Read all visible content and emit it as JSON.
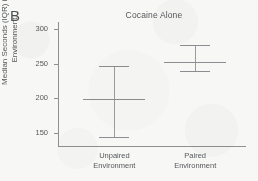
{
  "figure": {
    "panel_label": "B",
    "accent_color": "#8b8e90",
    "background_color": "#f7f7f6",
    "text_color": "#55585a"
  },
  "chart_data": {
    "type": "scatter",
    "title": "Cocaine Alone",
    "subtitle": "",
    "xlabel": "",
    "ylabel_line1": "Median Seconds (IQR) in",
    "ylabel_line2": "Environment",
    "ylabel": "Median Seconds (IQR) in Environment",
    "categories": [
      "Unpaired Environment",
      "Paired Environment"
    ],
    "category_lines": [
      [
        "Unpaired",
        "Environment"
      ],
      [
        "Paired",
        "Environment"
      ]
    ],
    "series": [
      {
        "name": "Median Seconds in Environment",
        "values": [
          199,
          252
        ],
        "iqr_low": [
          144,
          240
        ],
        "iqr_high": [
          246,
          277
        ]
      }
    ],
    "ylim": [
      130,
      310
    ],
    "yticks": [
      150,
      200,
      250,
      300
    ],
    "ytick_labels": [
      "150",
      "200",
      "250",
      "300"
    ],
    "grid": false,
    "legend": false,
    "legend_position": "none",
    "annotations": []
  }
}
